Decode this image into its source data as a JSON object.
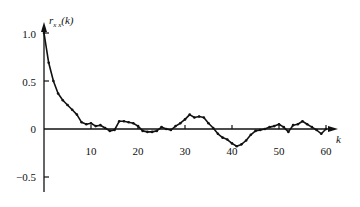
{
  "chart_data": {
    "type": "line",
    "title": "",
    "ylabel": "r_xx(k)",
    "xlabel": "k",
    "xlim": [
      0,
      63
    ],
    "ylim": [
      -0.7,
      1.1
    ],
    "grid": false,
    "legend": null,
    "x_ticks": [
      10,
      20,
      30,
      40,
      50,
      60
    ],
    "x_tick_labels": [
      "10",
      "20",
      "30",
      "40",
      "50",
      "60"
    ],
    "y_ticks": [
      1.0,
      0.5,
      0,
      -0.5
    ],
    "y_tick_labels": [
      "1.0",
      "0.5",
      "0",
      "−0.5"
    ],
    "series": [
      {
        "name": "r_xx(k)",
        "x": [
          0,
          1,
          2,
          3,
          4,
          5,
          6,
          7,
          8,
          9,
          10,
          11,
          12,
          13,
          14,
          15,
          16,
          17,
          18,
          19,
          20,
          21,
          22,
          23,
          24,
          25,
          26,
          27,
          28,
          29,
          30,
          31,
          32,
          33,
          34,
          35,
          36,
          37,
          38,
          39,
          40,
          41,
          42,
          43,
          44,
          45,
          46,
          47,
          48,
          49,
          50,
          51,
          52,
          53,
          54,
          55,
          56,
          57,
          58,
          59,
          60
        ],
        "values": [
          1.0,
          0.69,
          0.5,
          0.37,
          0.3,
          0.25,
          0.2,
          0.15,
          0.07,
          0.05,
          0.06,
          0.03,
          0.04,
          0.01,
          -0.02,
          -0.01,
          0.08,
          0.08,
          0.07,
          0.06,
          0.03,
          -0.02,
          -0.03,
          -0.03,
          -0.02,
          0.02,
          0.0,
          -0.01,
          0.03,
          0.06,
          0.1,
          0.15,
          0.12,
          0.13,
          0.12,
          0.06,
          0.01,
          -0.05,
          -0.09,
          -0.11,
          -0.15,
          -0.18,
          -0.16,
          -0.12,
          -0.06,
          -0.02,
          -0.01,
          0.0,
          0.02,
          0.03,
          0.05,
          0.02,
          -0.03,
          0.04,
          0.05,
          0.08,
          0.05,
          0.02,
          -0.01,
          -0.05,
          0.0
        ]
      }
    ]
  },
  "axis_labels": {
    "y_title_r": "r",
    "y_title_sub": "x x",
    "y_title_rest": "(k)",
    "x_title": "k"
  },
  "ticks": {
    "y": [
      "1.0",
      "0.5",
      "0",
      "−0.5"
    ],
    "x": [
      "10",
      "20",
      "30",
      "40",
      "50",
      "60"
    ]
  }
}
